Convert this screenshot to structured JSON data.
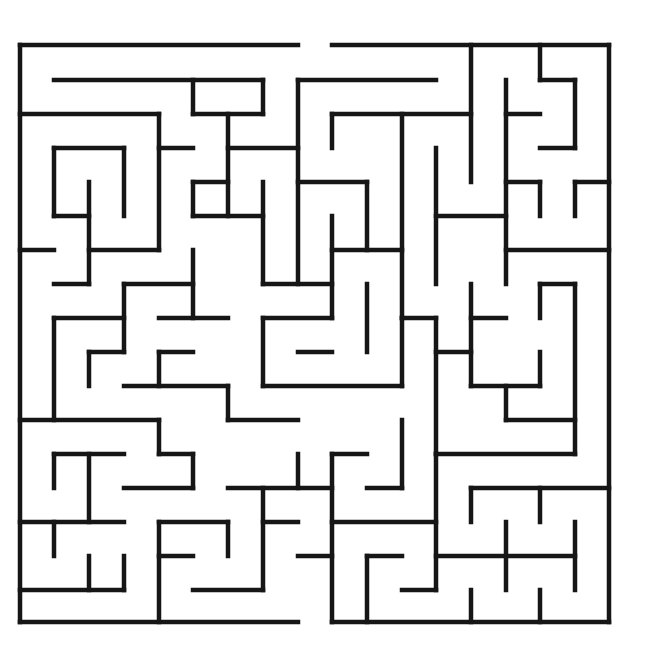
{
  "puzzle": {
    "type": "maze",
    "caption": "",
    "grid": {
      "cols": 17,
      "rows": 17,
      "x": [
        20,
        54,
        89,
        124,
        159,
        193,
        228,
        263,
        298,
        332,
        367,
        402,
        436,
        471,
        506,
        540,
        575,
        609
      ],
      "y": [
        45,
        80,
        114,
        148,
        182,
        216,
        250,
        284,
        318,
        352,
        386,
        420,
        454,
        488,
        522,
        556,
        590,
        622
      ]
    },
    "wall_color": "#161616",
    "background": "#ffffff",
    "entrance": {
      "side": "top",
      "between_x": [
        298,
        332
      ]
    },
    "exit": {
      "side": "bottom",
      "between_x": [
        298,
        335
      ]
    },
    "walls": [
      [
        0,
        0,
        8,
        0
      ],
      [
        9,
        0,
        17,
        0
      ],
      [
        0,
        0,
        0,
        17
      ],
      [
        17,
        0,
        17,
        17
      ],
      [
        0,
        17,
        8,
        17
      ],
      [
        9,
        17,
        17,
        17
      ],
      [
        1,
        1,
        7,
        1
      ],
      [
        5,
        1,
        5,
        2
      ],
      [
        5,
        2,
        7,
        2
      ],
      [
        7,
        1,
        7,
        2
      ],
      [
        0,
        2,
        4,
        2
      ],
      [
        4,
        2,
        4,
        6
      ],
      [
        4,
        3,
        5,
        3
      ],
      [
        6,
        2,
        6,
        5
      ],
      [
        6,
        3,
        8,
        3
      ],
      [
        8,
        1,
        8,
        7
      ],
      [
        8,
        1,
        12,
        1
      ],
      [
        1,
        3,
        3,
        3
      ],
      [
        1,
        3,
        1,
        5
      ],
      [
        1,
        5,
        2,
        5
      ],
      [
        3,
        3,
        3,
        5
      ],
      [
        2,
        4,
        2,
        7
      ],
      [
        2,
        6,
        4,
        6
      ],
      [
        1,
        7,
        2,
        7
      ],
      [
        5,
        4,
        6,
        4
      ],
      [
        5,
        4,
        5,
        5
      ],
      [
        5,
        5,
        7,
        5
      ],
      [
        7,
        4,
        7,
        7
      ],
      [
        0,
        6,
        1,
        6
      ],
      [
        9,
        2,
        13,
        2
      ],
      [
        9,
        2,
        9,
        3
      ],
      [
        10,
        4,
        10,
        6
      ],
      [
        8,
        4,
        10,
        4
      ],
      [
        11,
        2,
        11,
        8
      ],
      [
        13,
        0,
        13,
        4
      ],
      [
        14,
        1,
        14,
        7
      ],
      [
        14,
        2,
        15,
        2
      ],
      [
        15,
        0,
        15,
        1
      ],
      [
        15,
        1,
        16,
        1
      ],
      [
        16,
        1,
        16,
        3
      ],
      [
        15,
        3,
        16,
        3
      ],
      [
        12,
        3,
        12,
        7
      ],
      [
        12,
        5,
        14,
        5
      ],
      [
        9,
        5,
        9,
        8
      ],
      [
        9,
        6,
        11,
        6
      ],
      [
        14,
        4,
        15,
        4
      ],
      [
        15,
        4,
        15,
        5
      ],
      [
        16,
        4,
        17,
        4
      ],
      [
        16,
        4,
        16,
        5
      ],
      [
        14,
        6,
        17,
        6
      ],
      [
        7,
        7,
        9,
        7
      ],
      [
        10,
        7,
        10,
        9
      ],
      [
        13,
        7,
        13,
        10
      ],
      [
        13,
        8,
        14,
        8
      ],
      [
        1,
        8,
        1,
        11
      ],
      [
        1,
        8,
        3,
        8
      ],
      [
        3,
        7,
        3,
        9
      ],
      [
        3,
        7,
        5,
        7
      ],
      [
        5,
        6,
        5,
        8
      ],
      [
        4,
        8,
        6,
        8
      ],
      [
        2,
        9,
        3,
        9
      ],
      [
        2,
        9,
        2,
        10
      ],
      [
        4,
        9,
        5,
        9
      ],
      [
        4,
        9,
        4,
        10
      ],
      [
        3,
        10,
        6,
        10
      ],
      [
        6,
        10,
        6,
        11
      ],
      [
        6,
        11,
        8,
        11
      ],
      [
        7,
        8,
        9,
        8
      ],
      [
        7,
        8,
        7,
        10
      ],
      [
        7,
        10,
        11,
        10
      ],
      [
        11,
        8,
        11,
        10
      ],
      [
        8,
        9,
        9,
        9
      ],
      [
        11,
        8,
        12,
        8
      ],
      [
        12,
        8,
        12,
        12
      ],
      [
        12,
        9,
        13,
        9
      ],
      [
        13,
        10,
        15,
        10
      ],
      [
        15,
        9,
        15,
        10
      ],
      [
        14,
        11,
        16,
        11
      ],
      [
        14,
        10,
        14,
        11
      ],
      [
        15,
        7,
        16,
        7
      ],
      [
        15,
        7,
        15,
        8
      ],
      [
        16,
        7,
        16,
        12
      ],
      [
        12,
        12,
        16,
        12
      ],
      [
        0,
        11,
        4,
        11
      ],
      [
        4,
        11,
        4,
        12
      ],
      [
        4,
        12,
        5,
        12
      ],
      [
        5,
        12,
        5,
        13
      ],
      [
        3,
        13,
        5,
        13
      ],
      [
        1,
        12,
        3,
        12
      ],
      [
        1,
        12,
        1,
        13
      ],
      [
        2,
        12,
        2,
        14
      ],
      [
        0,
        14,
        3,
        14
      ],
      [
        1,
        14,
        1,
        15
      ],
      [
        6,
        13,
        9,
        13
      ],
      [
        8,
        12,
        8,
        13
      ],
      [
        7,
        13,
        7,
        16
      ],
      [
        7,
        14,
        8,
        14
      ],
      [
        9,
        12,
        10,
        12
      ],
      [
        9,
        12,
        9,
        17
      ],
      [
        11,
        11,
        11,
        13
      ],
      [
        10,
        13,
        11,
        13
      ],
      [
        9,
        14,
        12,
        14
      ],
      [
        12,
        12,
        12,
        16
      ],
      [
        10,
        15,
        11,
        15
      ],
      [
        10,
        15,
        10,
        17
      ],
      [
        11,
        16,
        12,
        16
      ],
      [
        4,
        14,
        6,
        14
      ],
      [
        4,
        14,
        4,
        17
      ],
      [
        4,
        15,
        5,
        15
      ],
      [
        6,
        14,
        6,
        15
      ],
      [
        5,
        16,
        7,
        16
      ],
      [
        8,
        15,
        9,
        15
      ],
      [
        0,
        16,
        3,
        16
      ],
      [
        2,
        15,
        2,
        16
      ],
      [
        3,
        15,
        3,
        16
      ],
      [
        13,
        13,
        17,
        13
      ],
      [
        13,
        13,
        13,
        14
      ],
      [
        15,
        13,
        15,
        14
      ],
      [
        12,
        15,
        16,
        15
      ],
      [
        14,
        14,
        14,
        16
      ],
      [
        16,
        14,
        16,
        16
      ],
      [
        13,
        16,
        13,
        17
      ],
      [
        15,
        16,
        15,
        17
      ]
    ]
  }
}
